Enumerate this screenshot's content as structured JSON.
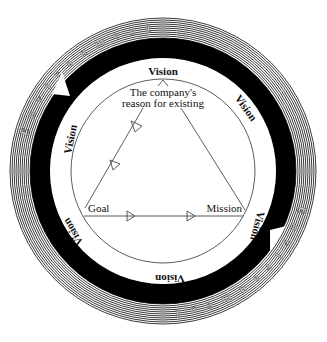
{
  "diagram": {
    "outer_ring_label": "Environment",
    "outer_ring_letters": [
      "E",
      "n",
      "v",
      "i",
      "r",
      "o",
      "n",
      "m",
      "e",
      "n",
      "t"
    ],
    "outer_ring_letters_bottom": [
      "E",
      "n",
      "v",
      "i",
      "r",
      "o",
      "n",
      "m",
      "e",
      "n",
      "t"
    ],
    "vision_label": "Vision",
    "vision_positions": [
      "top",
      "upper-right",
      "lower-right",
      "bottom",
      "lower-left",
      "upper-left"
    ],
    "apex_label_line1": "The company's",
    "apex_label_line2": "reason for existing",
    "goal_label": "Goal",
    "mission_label": "Mission"
  },
  "colors": {
    "ring_stripe_dark": "#222222",
    "ring_stripe_light": "#ffffff",
    "band": "#000000",
    "line": "#333333"
  }
}
